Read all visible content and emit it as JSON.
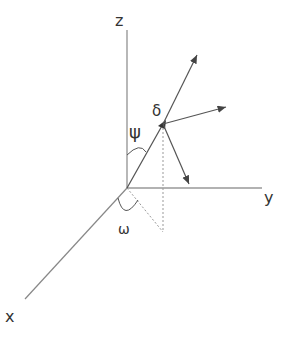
{
  "diagram": {
    "type": "3d-coordinate-system",
    "axes": {
      "x": {
        "label": "x"
      },
      "y": {
        "label": "y"
      },
      "z": {
        "label": "z"
      }
    },
    "angles": {
      "polar": {
        "symbol": "ψ"
      },
      "azimuth": {
        "symbol": "ω"
      },
      "point": {
        "symbol": "δ"
      }
    },
    "colors": {
      "line": "#555555",
      "dotted": "#888888",
      "text": "#333333"
    }
  }
}
